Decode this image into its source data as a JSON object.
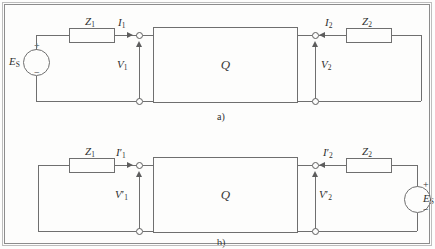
{
  "figure": {
    "captions": {
      "a": "a)",
      "b": "b)"
    },
    "network_label": "Q",
    "colors": {
      "wire": "#6f6f6f",
      "text": "#2f2f2f",
      "paper": "#fdfdfc",
      "frame": "#8c8c8c"
    }
  },
  "circuit_a": {
    "caption": "a)",
    "network": "Q",
    "source": {
      "label": "E",
      "sublabel": "S",
      "plus": "+",
      "minus": "−",
      "side": "left"
    },
    "impedance_left": {
      "label": "Z",
      "sublabel": "1"
    },
    "impedance_right": {
      "label": "Z",
      "sublabel": "2"
    },
    "current_left": {
      "label": "I",
      "prime": "",
      "sublabel": "1",
      "direction": "right"
    },
    "current_right": {
      "label": "I",
      "prime": "",
      "sublabel": "2",
      "direction": "left"
    },
    "voltage_left": {
      "label": "V",
      "prime": "",
      "sublabel": "1",
      "direction": "up"
    },
    "voltage_right": {
      "label": "V",
      "prime": "",
      "sublabel": "2",
      "direction": "up"
    }
  },
  "circuit_b": {
    "caption": "b)",
    "network": "Q",
    "source": {
      "label": "E",
      "sublabel": "S",
      "plus": "+",
      "minus": "−",
      "side": "right"
    },
    "impedance_left": {
      "label": "Z",
      "sublabel": "1"
    },
    "impedance_right": {
      "label": "Z",
      "sublabel": "2"
    },
    "current_left": {
      "label": "I",
      "prime": "′",
      "sublabel": "1",
      "direction": "right"
    },
    "current_right": {
      "label": "I",
      "prime": "′",
      "sublabel": "2",
      "direction": "left"
    },
    "voltage_left": {
      "label": "V",
      "prime": "′",
      "sublabel": "1",
      "direction": "up"
    },
    "voltage_right": {
      "label": "V",
      "prime": "′",
      "sublabel": "2",
      "direction": "up"
    }
  }
}
